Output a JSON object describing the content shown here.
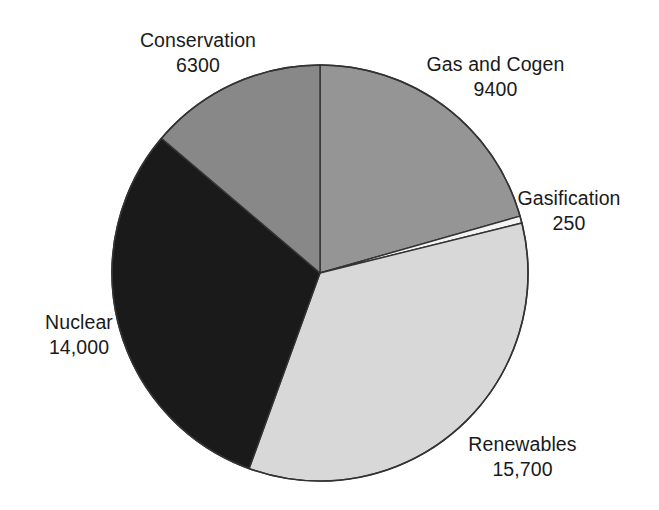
{
  "chart_data": {
    "type": "pie",
    "title": "",
    "subtitle": "",
    "xlabel": "",
    "ylabel": "",
    "legend_position": "none",
    "grid": false,
    "labels_outside": true,
    "total": 45650,
    "units": "MW",
    "start_angle_deg": 0,
    "direction": "clockwise",
    "center": {
      "x": 320,
      "y": 273
    },
    "radius": 208,
    "categories": [
      "Gas and Cogen",
      "Gasification",
      "Renewables",
      "Nuclear",
      "Conservation"
    ],
    "values": [
      9400,
      250,
      15700,
      14000,
      6300
    ],
    "value_labels": [
      "9400",
      "250",
      "15,700",
      "14,000",
      "6300"
    ],
    "colors": [
      "#959595",
      "#f4f4f4",
      "#d8d8d8",
      "#1a1a1a",
      "#888888"
    ],
    "slices": [
      {
        "name": "Gas and Cogen",
        "label": "Gas and Cogen",
        "value": 9400,
        "value_label": "9400",
        "color": "#959595",
        "percent": 20.6,
        "start_deg": 0,
        "end_deg": 74.13
      },
      {
        "name": "Gasification",
        "label": "Gasification",
        "value": 250,
        "value_label": "250",
        "color": "#f4f4f4",
        "percent": 0.5,
        "start_deg": 74.13,
        "end_deg": 76.1
      },
      {
        "name": "Renewables",
        "label": "Renewables",
        "value": 15700,
        "value_label": "15,700",
        "color": "#d8d8d8",
        "percent": 34.4,
        "start_deg": 76.1,
        "end_deg": 199.92
      },
      {
        "name": "Nuclear",
        "label": "Nuclear",
        "value": 14000,
        "value_label": "14,000",
        "color": "#1a1a1a",
        "percent": 30.7,
        "start_deg": 199.92,
        "end_deg": 310.34
      },
      {
        "name": "Conservation",
        "label": "Conservation",
        "value": 6300,
        "value_label": "6300",
        "color": "#888888",
        "percent": 13.8,
        "start_deg": 310.34,
        "end_deg": 360
      }
    ],
    "outline_color": "#333333",
    "background_color": "#ffffff"
  }
}
